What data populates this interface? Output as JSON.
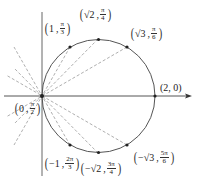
{
  "diagram": {
    "type": "polar-circle-plot",
    "colors": {
      "axis": "#555555",
      "circle": "#555555",
      "dashed": "#999999",
      "point": "#222222",
      "label": "#222222"
    },
    "axes": {
      "horizontal_arrow": true,
      "vertical_axis": true
    },
    "points": [
      {
        "id": "p0",
        "r": "0",
        "theta": "π/2",
        "label_r": "0",
        "label_theta_num": "π",
        "label_theta_den": "2"
      },
      {
        "id": "p1",
        "r": "1",
        "theta": "π/3",
        "label_r": "1",
        "label_theta_num": "π",
        "label_theta_den": "3"
      },
      {
        "id": "p2",
        "r": "√2",
        "theta": "π/4",
        "label_r": "√2",
        "label_theta_num": "π",
        "label_theta_den": "4"
      },
      {
        "id": "p3",
        "r": "√3",
        "theta": "π/6",
        "label_r": "√3",
        "label_theta_num": "π",
        "label_theta_den": "6"
      },
      {
        "id": "p4",
        "r": "2",
        "theta": "0",
        "label_plain": "(2, 0)"
      },
      {
        "id": "p5",
        "r": "−1",
        "theta": "2π/3",
        "label_r": "−1",
        "label_theta_num": "2π",
        "label_theta_den": "3"
      },
      {
        "id": "p6",
        "r": "−√2",
        "theta": "3π/4",
        "label_r": "−√2",
        "label_theta_num": "3π",
        "label_theta_den": "4"
      },
      {
        "id": "p7",
        "r": "−√3",
        "theta": "5π/6",
        "label_r": "−√3",
        "label_theta_num": "5π",
        "label_theta_den": "6"
      }
    ]
  }
}
